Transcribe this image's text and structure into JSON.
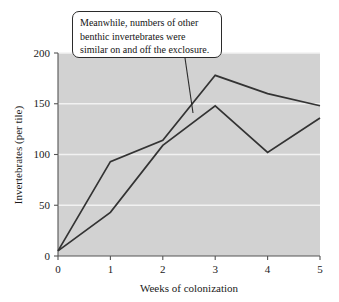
{
  "annotation": {
    "name": "callout",
    "lines": [
      "Meanwhile, numbers of other",
      "benthic invertebrates were",
      "similar on and off the exclosure."
    ],
    "text": "Meanwhile, numbers of other benthic invertebrates were similar on and off the exclosure."
  },
  "chart_data": {
    "type": "line",
    "title": "",
    "xlabel": "Weeks of colonization",
    "ylabel": "Invertebrates (per tile)",
    "x": [
      0,
      1,
      2,
      3,
      4,
      5
    ],
    "xticklabels": [
      "0",
      "1",
      "2",
      "3",
      "4",
      "5"
    ],
    "yticks": [
      0,
      50,
      100,
      150,
      200
    ],
    "yticklabels": [
      "0",
      "50",
      "100",
      "150",
      "200"
    ],
    "xlim": [
      0,
      5
    ],
    "ylim": [
      0,
      200
    ],
    "grid": "horizontal",
    "legend": "none",
    "plot_background": "#d2d2d2",
    "gridline_color": "#f2f2f2",
    "line_color": "#333333",
    "series": [
      {
        "name": "On exclosure",
        "values": [
          5,
          93,
          114,
          178,
          160,
          148
        ]
      },
      {
        "name": "Off exclosure",
        "values": [
          5,
          43,
          109,
          148,
          102,
          136
        ]
      }
    ],
    "annotations": [
      {
        "text": "Meanwhile, numbers of other benthic invertebrates were similar on and off the exclosure.",
        "points_to_x": 2.65,
        "points_to_y": 140
      }
    ]
  },
  "axes": {
    "y_tick_0": "0",
    "y_tick_50": "50",
    "y_tick_100": "100",
    "y_tick_150": "150",
    "y_tick_200": "200",
    "x_tick_0": "0",
    "x_tick_1": "1",
    "x_tick_2": "2",
    "x_tick_3": "3",
    "x_tick_4": "4",
    "x_tick_5": "5",
    "x_title": "Weeks of colonization",
    "y_title": "Invertebrates (per tile)"
  }
}
